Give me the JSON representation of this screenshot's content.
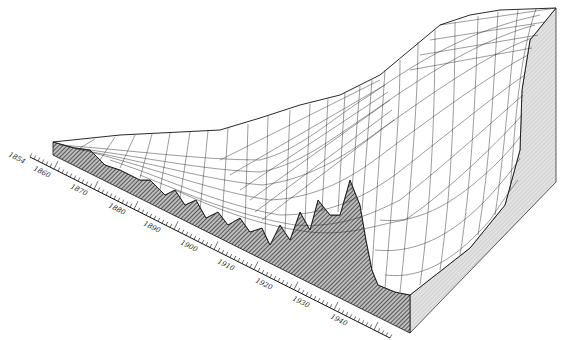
{
  "chart_data": {
    "type": "surface3d",
    "title": "",
    "xlabel": "Year",
    "ylabel": "",
    "zlabel": "",
    "x_axis": {
      "tick_labels": [
        "1854",
        "1860",
        "1870",
        "1880",
        "1890",
        "1900",
        "1910",
        "1920",
        "1930",
        "1940"
      ],
      "range": [
        1854,
        1945
      ]
    },
    "style": {
      "wireframe": true,
      "front_face_fill": "hatched-dark",
      "side_face_fill": "stippled-light",
      "line_color": "#111111",
      "background": "#ffffff"
    }
  },
  "axis": {
    "ticks": [
      {
        "label": "1854"
      },
      {
        "label": "1860"
      },
      {
        "label": "1870"
      },
      {
        "label": "1880"
      },
      {
        "label": "1890"
      },
      {
        "label": "1900"
      },
      {
        "label": "1910"
      },
      {
        "label": "1920"
      },
      {
        "label": "1930"
      },
      {
        "label": "1940"
      }
    ]
  },
  "colors": {
    "ink": "#111111",
    "side_face": "#cfcfcf",
    "front_face": "#7a7a7a",
    "surface": "#ffffff"
  }
}
